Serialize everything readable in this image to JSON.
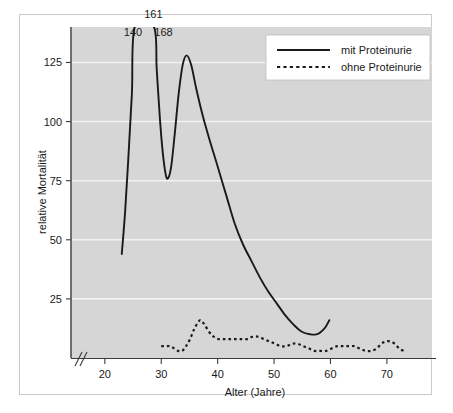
{
  "chart_data": {
    "type": "line",
    "title": "",
    "xlabel": "Alter (Jahre)",
    "ylabel": "relative Mortalität",
    "xlim": [
      14,
      78
    ],
    "ylim": [
      0,
      140
    ],
    "xticks": [
      20,
      30,
      40,
      50,
      60,
      70
    ],
    "yticks": [
      25,
      50,
      75,
      100,
      125
    ],
    "grid": "horizontal",
    "axis_break": "//",
    "legend_position": "top-right",
    "annotations": [
      {
        "label": "186",
        "x": 30.0,
        "y": 152
      },
      {
        "label": "161",
        "x": 28.6,
        "y": 144
      },
      {
        "label": "140",
        "x": 25.0,
        "y": 136
      },
      {
        "label": "168",
        "x": 30.4,
        "y": 136
      }
    ],
    "series": [
      {
        "name": "mit Proteinurie",
        "style": "solid",
        "color": "#1a1a1a",
        "points": [
          [
            23.0,
            44
          ],
          [
            23.6,
            62
          ],
          [
            24.2,
            86
          ],
          [
            24.8,
            112
          ],
          [
            25.3,
            140
          ],
          [
            28.7,
            140
          ],
          [
            29.2,
            122
          ],
          [
            29.8,
            100
          ],
          [
            30.4,
            84
          ],
          [
            31.0,
            76
          ],
          [
            31.7,
            80
          ],
          [
            32.4,
            95
          ],
          [
            33.1,
            112
          ],
          [
            33.8,
            124
          ],
          [
            34.5,
            128
          ],
          [
            35.3,
            124
          ],
          [
            36.2,
            114
          ],
          [
            37.3,
            103
          ],
          [
            38.6,
            92
          ],
          [
            40.0,
            81
          ],
          [
            41.5,
            69
          ],
          [
            43.0,
            57
          ],
          [
            44.5,
            48
          ],
          [
            46.0,
            41
          ],
          [
            47.5,
            34
          ],
          [
            49.0,
            28
          ],
          [
            50.5,
            23
          ],
          [
            52.0,
            18
          ],
          [
            53.5,
            14
          ],
          [
            55.0,
            11
          ],
          [
            56.5,
            10
          ],
          [
            57.5,
            10
          ],
          [
            58.3,
            11
          ],
          [
            59.1,
            13
          ],
          [
            59.8,
            16
          ]
        ]
      },
      {
        "name": "ohne Proteinurie",
        "style": "dotted",
        "color": "#1a1a1a",
        "points": [
          [
            30.0,
            5
          ],
          [
            30.8,
            5
          ],
          [
            31.6,
            5
          ],
          [
            32.3,
            4
          ],
          [
            33.0,
            3
          ],
          [
            33.7,
            3
          ],
          [
            34.4,
            5
          ],
          [
            35.1,
            8
          ],
          [
            35.8,
            12
          ],
          [
            36.5,
            15
          ],
          [
            37.0,
            16
          ],
          [
            37.7,
            14
          ],
          [
            38.5,
            11
          ],
          [
            39.3,
            9
          ],
          [
            40.2,
            8
          ],
          [
            41.2,
            8
          ],
          [
            42.2,
            8
          ],
          [
            43.2,
            8
          ],
          [
            44.2,
            8
          ],
          [
            45.2,
            8
          ],
          [
            46.2,
            9
          ],
          [
            47.2,
            9
          ],
          [
            48.2,
            8
          ],
          [
            49.2,
            7
          ],
          [
            50.2,
            6
          ],
          [
            51.2,
            5
          ],
          [
            52.2,
            5
          ],
          [
            53.2,
            6
          ],
          [
            54.2,
            6
          ],
          [
            55.2,
            5
          ],
          [
            56.2,
            4
          ],
          [
            57.2,
            3
          ],
          [
            58.2,
            3
          ],
          [
            59.2,
            3
          ],
          [
            60.2,
            4
          ],
          [
            61.2,
            5
          ],
          [
            62.2,
            5
          ],
          [
            63.2,
            5
          ],
          [
            64.2,
            5
          ],
          [
            65.2,
            4
          ],
          [
            66.2,
            3
          ],
          [
            67.2,
            3
          ],
          [
            68.2,
            4
          ],
          [
            69.0,
            6
          ],
          [
            69.8,
            7
          ],
          [
            70.6,
            7
          ],
          [
            71.4,
            6
          ],
          [
            72.2,
            4
          ],
          [
            73.0,
            3
          ]
        ]
      }
    ],
    "legend": [
      {
        "label": "mit Proteinurie",
        "style": "solid"
      },
      {
        "label": "ohne Proteinurie",
        "style": "dotted"
      }
    ]
  }
}
